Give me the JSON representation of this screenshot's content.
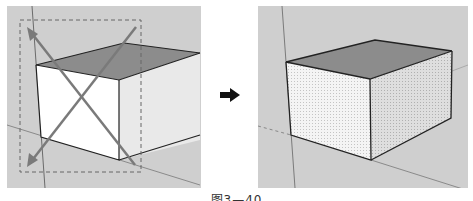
{
  "figure": {
    "caption": "图3—40",
    "panels": [
      {
        "name": "before",
        "description": "Box with crossing selection window (dashed rectangle, diagonal arrows)"
      },
      {
        "name": "after",
        "description": "Box with all faces selected (dotted highlight)"
      }
    ],
    "transition_icon": "right-arrow-icon",
    "colors": {
      "background": "#cfcfcf",
      "top_face": "#8c8c8c",
      "front_face": "#ffffff",
      "side_face": "#e6e6e6",
      "edges": "#222222",
      "selection_arrows": "#7a7a7a",
      "selection_box": "#666666"
    }
  }
}
